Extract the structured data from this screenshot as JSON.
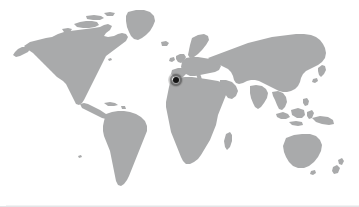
{
  "panel": {
    "background_color": "#ffffff",
    "border_color": "#e3e5e7",
    "accent_bar_color": "#4e5256",
    "width": 359,
    "height": 207
  },
  "map": {
    "type": "world-silhouette",
    "projection": "equirectangular",
    "land_color": "#a9aaab",
    "ocean_color": "#ffffff",
    "alt_text": "World map",
    "regions": [
      "North America",
      "Greenland",
      "South America",
      "Europe",
      "Africa",
      "Asia",
      "Australia",
      "New Zealand",
      "Japan",
      "Indonesia",
      "Madagascar",
      "British Isles"
    ]
  },
  "marker": {
    "label": "Location marker",
    "icon": "map-pin-dot-icon",
    "dot_color": "#141414",
    "halo_color": "#6e6e6e",
    "x": 176,
    "y": 80,
    "region_hint": "Strait of Gibraltar / Northwest Africa"
  }
}
